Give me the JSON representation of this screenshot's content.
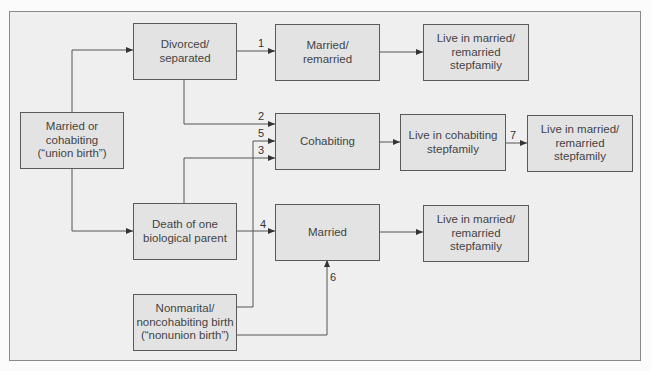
{
  "diagram": {
    "type": "flowchart",
    "nodes": {
      "union_birth": "Married or\ncohabiting\n(“union birth”)",
      "divorced": "Divorced/\nseparated",
      "death": "Death of one\nbiological parent",
      "nonunion_birth": "Nonmarital/\nnoncohabiting birth\n(“nonunion birth”)",
      "married_remarried": "Married/\nremarried",
      "cohabiting": "Cohabiting",
      "married": "Married",
      "live_married_1": "Live in married/\nremarried\nstepfamily",
      "live_cohabiting": "Live in cohabiting\nstepfamily",
      "live_married_2": "Live in married/\nremarried\nstepfamily",
      "live_married_3": "Live in married/\nremarried\nstepfamily"
    },
    "edge_labels": {
      "p1": "1",
      "p2": "2",
      "p3": "3",
      "p4": "4",
      "p5": "5",
      "p6": "6",
      "p7": "7"
    },
    "edges": [
      {
        "from": "union_birth",
        "to": "divorced",
        "label": ""
      },
      {
        "from": "union_birth",
        "to": "death",
        "label": ""
      },
      {
        "from": "divorced",
        "to": "married_remarried",
        "label": "1"
      },
      {
        "from": "divorced",
        "to": "cohabiting",
        "label": "2"
      },
      {
        "from": "death",
        "to": "cohabiting",
        "label": "3"
      },
      {
        "from": "death",
        "to": "married",
        "label": "4"
      },
      {
        "from": "nonunion_birth",
        "to": "cohabiting",
        "label": "5"
      },
      {
        "from": "nonunion_birth",
        "to": "married",
        "label": "6"
      },
      {
        "from": "live_cohabiting",
        "to": "live_married_2",
        "label": "7"
      },
      {
        "from": "married_remarried",
        "to": "live_married_1",
        "label": ""
      },
      {
        "from": "cohabiting",
        "to": "live_cohabiting",
        "label": ""
      },
      {
        "from": "married",
        "to": "live_married_3",
        "label": ""
      }
    ],
    "colors": {
      "box_fill": "#e3e3e3",
      "background": "#efefef",
      "line": "#555555"
    }
  }
}
